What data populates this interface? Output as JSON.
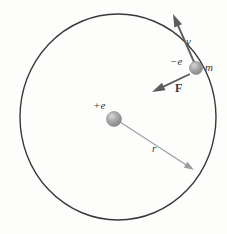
{
  "figure": {
    "background_color": "#fdfdfc",
    "ink_color": "#39383a",
    "sphere_color": "#9a9a9c",
    "sphere_highlight_color": "#c9c9cb",
    "arrow_color": "#5d5c5e",
    "radius_line_color": "#9d9c9e"
  },
  "orbit": {
    "name": "circular-orbit",
    "center_x": 118,
    "center_y": 117,
    "radius_x": 98,
    "radius_y": 103,
    "stroke_width": 1.4
  },
  "nucleus": {
    "label": "+e",
    "x": 114,
    "y": 119,
    "radius": 7.5
  },
  "electron": {
    "charge_label": "−e",
    "mass_label": "m",
    "x": 196,
    "y": 68,
    "radius": 6.5
  },
  "vectors": {
    "velocity": {
      "label": "v",
      "from_x": 194,
      "from_y": 62,
      "to_x": 173,
      "to_y": 14
    },
    "force": {
      "label": "F",
      "from_x": 190,
      "from_y": 74,
      "to_x": 152,
      "to_y": 92
    },
    "radius": {
      "label": "r",
      "from_x": 120,
      "from_y": 122,
      "to_x": 194,
      "to_y": 170
    }
  }
}
